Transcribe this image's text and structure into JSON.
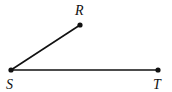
{
  "diagram": {
    "type": "angle",
    "points": {
      "R": {
        "label": "R",
        "x": 80,
        "y": 25
      },
      "S": {
        "label": "S",
        "x": 11,
        "y": 70
      },
      "T": {
        "label": "T",
        "x": 158,
        "y": 70
      }
    },
    "segments": [
      {
        "from": "S",
        "to": "R"
      },
      {
        "from": "S",
        "to": "T"
      }
    ],
    "vertex": "S",
    "colors": {
      "stroke": "#111111",
      "background": "#ffffff"
    }
  }
}
